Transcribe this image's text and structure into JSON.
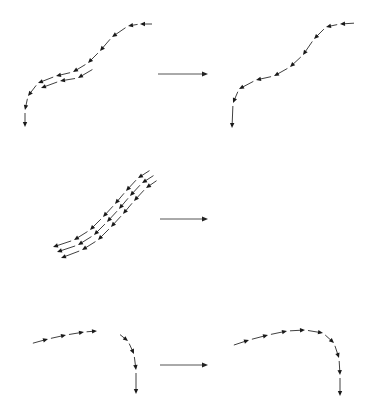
{
  "diagram": {
    "colors": {
      "background": "#ffffff",
      "arrow": "#1a1a1a",
      "transition_arrow": "#555555"
    },
    "rows": [
      {
        "id": "row-1",
        "label": "Diverging parallel segments merged into one streamline",
        "transition_arrow": {
          "x1": 158,
          "y1": 74,
          "x2": 208,
          "y2": 74
        },
        "before": [
          [
            [
              155,
              24
            ],
            [
              140,
              24
            ],
            [
              128,
              26
            ],
            [
              112,
              37
            ],
            [
              100,
              51
            ],
            [
              88,
              63
            ],
            [
              73,
              72
            ],
            [
              56,
              76
            ],
            [
              38,
              83
            ],
            [
              28,
              96
            ],
            [
              25,
              110
            ],
            [
              25,
              127
            ]
          ],
          [
            [
              95,
              68
            ],
            [
              78,
              78
            ],
            [
              60,
              81
            ],
            [
              41,
              88
            ]
          ]
        ],
        "after": [
          [
            [
              357,
              23
            ],
            [
              340,
              24
            ],
            [
              326,
              27
            ],
            [
              314,
              39
            ],
            [
              303,
              55
            ],
            [
              290,
              67
            ],
            [
              274,
              76
            ],
            [
              256,
              80
            ],
            [
              239,
              89
            ],
            [
              233,
              103
            ],
            [
              232,
              128
            ]
          ]
        ]
      },
      {
        "id": "row-2",
        "label": "Three parallel streamlines removed",
        "transition_arrow": {
          "x1": 160,
          "y1": 219,
          "x2": 208,
          "y2": 219
        },
        "before": [
          [
            [
              152,
              169
            ],
            [
              138,
              178
            ],
            [
              126,
              191
            ],
            [
              115,
              204
            ],
            [
              103,
              217
            ],
            [
              90,
              230
            ],
            [
              74,
              240
            ],
            [
              53,
              247
            ]
          ],
          [
            [
              156,
              174
            ],
            [
              142,
              183
            ],
            [
              130,
              196
            ],
            [
              119,
              209
            ],
            [
              107,
              222
            ],
            [
              94,
              235
            ],
            [
              78,
              245
            ],
            [
              57,
              252
            ]
          ],
          [
            [
              159,
              179
            ],
            [
              146,
              188
            ],
            [
              134,
              201
            ],
            [
              123,
              214
            ],
            [
              111,
              227
            ],
            [
              98,
              240
            ],
            [
              82,
              250
            ],
            [
              61,
              258
            ]
          ]
        ],
        "after": []
      },
      {
        "id": "row-3",
        "label": "Two broken streamlines joined",
        "transition_arrow": {
          "x1": 160,
          "y1": 365,
          "x2": 208,
          "y2": 365
        },
        "before": [
          [
            [
              30,
              344
            ],
            [
              48,
              339
            ],
            [
              66,
              335
            ],
            [
              84,
              332
            ],
            [
              97,
              331
            ]
          ],
          [
            [
              118,
              333
            ],
            [
              128,
              341
            ],
            [
              134,
              354
            ],
            [
              136,
              370
            ],
            [
              136,
              394
            ]
          ]
        ],
        "after": [
          [
            [
              231,
              346
            ],
            [
              249,
              340
            ],
            [
              268,
              335
            ],
            [
              287,
              331
            ],
            [
              305,
              330
            ],
            [
              323,
              333
            ],
            [
              334,
              343
            ],
            [
              339,
              358
            ],
            [
              340,
              375
            ],
            [
              340,
              396
            ]
          ]
        ]
      }
    ]
  }
}
